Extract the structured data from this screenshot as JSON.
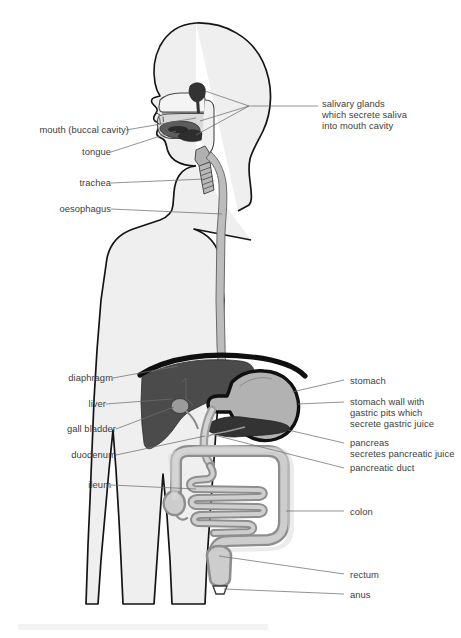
{
  "diagram": {
    "type": "anatomical-diagram",
    "background_color": "#ffffff",
    "body_fill": "#efefef",
    "body_outline": "#141414",
    "colors": {
      "body_fill": "#efefef",
      "body_outline": "#141414",
      "liver": "#4b4b4b",
      "stomach_fill": "#b0b0b0",
      "stomach_wall": "#141414",
      "pancreas": "#3a3a3a",
      "intestine_fill": "#cfcfcf",
      "intestine_wall": "#8e8e8e",
      "colon_fill": "#cbcbcb",
      "oesophagus": "#b7b7b7",
      "trachea": "#b3b3b3",
      "salivary_gland": "#3a3a3a",
      "tongue": "#5a5a5a",
      "gall_bladder": "#9a9a9a",
      "leader_line": "#6f6f6f",
      "label_text": "#404040"
    }
  },
  "labels": {
    "left": [
      {
        "id": "mouth",
        "text": "mouth (buccal cavity)",
        "x": 19,
        "y": 124
      },
      {
        "id": "tongue",
        "text": "tongue",
        "x": 76,
        "y": 146
      },
      {
        "id": "trachea",
        "text": "trachea",
        "x": 74,
        "y": 177
      },
      {
        "id": "oesophagus",
        "text": "oesophagus",
        "x": 58,
        "y": 203
      },
      {
        "id": "diaphragm",
        "text": "diaphragm",
        "x": 59,
        "y": 372
      },
      {
        "id": "liver",
        "text": "liver",
        "x": 87,
        "y": 398
      },
      {
        "id": "gallbladder",
        "text": "gall bladder",
        "x": 57,
        "y": 423
      },
      {
        "id": "duodenum",
        "text": "duodenum",
        "x": 62,
        "y": 449
      },
      {
        "id": "ileum",
        "text": "ileum",
        "x": 85,
        "y": 479
      }
    ],
    "right": [
      {
        "id": "salivary-glands",
        "text": "salivary glands\nwhich secrete saliva\ninto mouth cavity",
        "x": 322,
        "y": 103
      },
      {
        "id": "stomach",
        "text": "stomach",
        "x": 350,
        "y": 375
      },
      {
        "id": "stomach-wall",
        "text": "stomach wall with\ngastric pits which\nsecrete gastric juice",
        "x": 350,
        "y": 396
      },
      {
        "id": "pancreas",
        "text": "pancreas\nsecretes pancreatic juice",
        "x": 350,
        "y": 437
      },
      {
        "id": "pancreatic-duct",
        "text": "pancreatic duct",
        "x": 350,
        "y": 462
      },
      {
        "id": "colon",
        "text": "colon",
        "x": 350,
        "y": 506
      },
      {
        "id": "rectum",
        "text": "rectum",
        "x": 350,
        "y": 570
      },
      {
        "id": "anus",
        "text": "anus",
        "x": 350,
        "y": 590
      }
    ]
  },
  "organs": [
    {
      "id": "salivary-glands",
      "name": "salivary glands"
    },
    {
      "id": "mouth",
      "name": "mouth (buccal cavity)"
    },
    {
      "id": "tongue",
      "name": "tongue"
    },
    {
      "id": "trachea",
      "name": "trachea"
    },
    {
      "id": "oesophagus",
      "name": "oesophagus"
    },
    {
      "id": "diaphragm",
      "name": "diaphragm"
    },
    {
      "id": "liver",
      "name": "liver"
    },
    {
      "id": "gall-bladder",
      "name": "gall bladder"
    },
    {
      "id": "stomach",
      "name": "stomach"
    },
    {
      "id": "pancreas",
      "name": "pancreas"
    },
    {
      "id": "duodenum",
      "name": "duodenum"
    },
    {
      "id": "ileum",
      "name": "ileum"
    },
    {
      "id": "colon",
      "name": "colon"
    },
    {
      "id": "rectum",
      "name": "rectum"
    },
    {
      "id": "anus",
      "name": "anus"
    }
  ]
}
